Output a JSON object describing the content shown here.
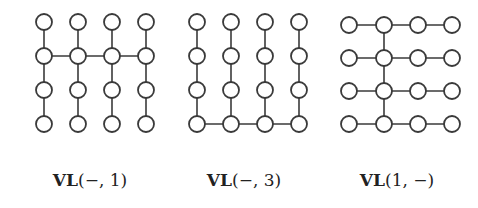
{
  "colors": {
    "stroke": "#3a3a3a",
    "node_fill": "#ffffff",
    "background": "#ffffff",
    "text": "#222222"
  },
  "node_radius": 8,
  "panels": [
    {
      "id": "vl-minus-1",
      "label_prefix": "VL",
      "label_args": "(−, 1)",
      "label_x": 90,
      "cols": [
        44,
        78,
        112,
        146
      ],
      "rows": [
        22,
        56,
        90,
        124
      ],
      "description": "Four vertical columns of 4 nodes each; horizontal edges connect all columns along row 2"
    },
    {
      "id": "vl-minus-3",
      "label_prefix": "VL",
      "label_args": "(−, 3)",
      "label_x": 244,
      "cols": [
        197,
        231,
        265,
        299
      ],
      "rows": [
        22,
        56,
        90,
        124
      ],
      "description": "Four vertical columns of 4 nodes each; horizontal edges connect all columns along row 4"
    },
    {
      "id": "vl-1-minus",
      "label_prefix": "VL",
      "label_args": "(1, −)",
      "label_x": 397,
      "cols": [
        349,
        384,
        418,
        452
      ],
      "rows": [
        25,
        58,
        91,
        124
      ],
      "description": "Four horizontal rows of 4 nodes each; vertical edges connect all rows along column 2"
    }
  ]
}
